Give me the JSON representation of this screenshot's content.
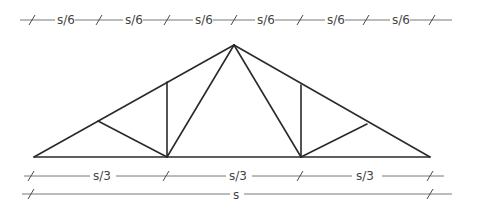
{
  "diagram": {
    "title": "",
    "type": "roof truss with dimension lines",
    "truss": {
      "apex": [
        234,
        45
      ],
      "left_support": [
        34,
        157
      ],
      "right_support": [
        430,
        157
      ],
      "bottom_panel_points": [
        [
          167,
          157
        ],
        [
          301,
          157
        ]
      ],
      "top_chord_points": [
        [
          98,
          121
        ],
        [
          167,
          82
        ],
        [
          301,
          85
        ],
        [
          367,
          124
        ]
      ],
      "members": [
        {
          "name": "top-chord-left",
          "from": [
            34,
            157
          ],
          "to": [
            234,
            45
          ]
        },
        {
          "name": "top-chord-right",
          "from": [
            234,
            45
          ],
          "to": [
            430,
            157
          ]
        },
        {
          "name": "bottom-chord",
          "from": [
            34,
            157
          ],
          "to": [
            430,
            157
          ]
        },
        {
          "name": "web-left-diagonal-outer",
          "from": [
            98,
            121
          ],
          "to": [
            167,
            157
          ]
        },
        {
          "name": "web-left-vertical",
          "from": [
            167,
            82
          ],
          "to": [
            167,
            157
          ]
        },
        {
          "name": "web-left-diagonal-inner",
          "from": [
            167,
            157
          ],
          "to": [
            234,
            45
          ]
        },
        {
          "name": "web-right-diagonal-inner",
          "from": [
            234,
            45
          ],
          "to": [
            301,
            157
          ]
        },
        {
          "name": "web-right-vertical",
          "from": [
            301,
            85
          ],
          "to": [
            301,
            157
          ]
        },
        {
          "name": "web-right-diagonal-outer",
          "from": [
            301,
            157
          ],
          "to": [
            367,
            124
          ]
        }
      ]
    },
    "dimensions": {
      "top_row": {
        "y": 20,
        "ticks": [
          32,
          99,
          167,
          234,
          300,
          366,
          432
        ],
        "labels": [
          "s⁄6",
          "s⁄6",
          "s⁄6",
          "s⁄6",
          "s⁄6",
          "s⁄6"
        ],
        "label_text": "s/6"
      },
      "middle_row": {
        "y": 176,
        "ticks": [
          31,
          166,
          300,
          430
        ],
        "labels": [
          "s/3",
          "s/3",
          "s/3"
        ]
      },
      "bottom_row": {
        "y": 194,
        "ticks": [
          31,
          430
        ],
        "labels": [
          "s"
        ]
      }
    }
  }
}
